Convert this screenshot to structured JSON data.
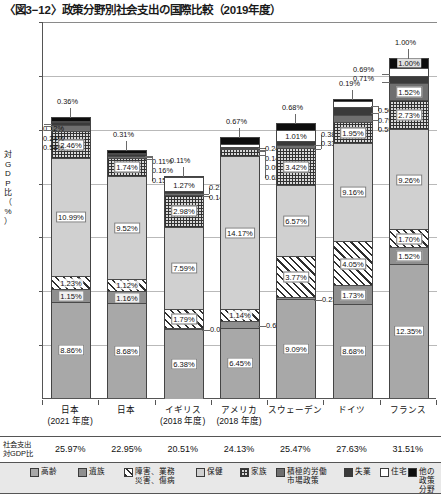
{
  "title": "〈図3−12〉政策分野別社会支出の国際比較（2019年度）",
  "axis": {
    "y_label": "対GDP比（%）",
    "y_ticks": [
      "35%",
      "30%",
      "25%",
      "20%",
      "15%",
      "10%",
      "5%"
    ]
  },
  "totals_row": {
    "label": "社会支出\n対GDP比",
    "values": [
      "25.97%",
      "22.95%",
      "20.51%",
      "24.13%",
      "25.47%",
      "27.63%",
      "31.51%"
    ]
  },
  "legend": [
    {
      "key": "koure",
      "label": "高齢",
      "color": "#a8a8a8"
    },
    {
      "key": "izoku",
      "label": "遺族",
      "color": "#8f8f8f"
    },
    {
      "key": "shogai",
      "label": "障害、業務\n災害、傷病",
      "color": "#ffffff"
    },
    {
      "key": "hoken",
      "label": "保健",
      "color": "#d0d0d0"
    },
    {
      "key": "kazoku",
      "label": "家族",
      "color": "#d8d8d8"
    },
    {
      "key": "roudou",
      "label": "積極的労働\n市場政策",
      "color": "#6f6f6f"
    },
    {
      "key": "shitsugyo",
      "label": "失業",
      "color": "#3a3a3a"
    },
    {
      "key": "jutaku",
      "label": "住宅",
      "color": "#ffffff"
    },
    {
      "key": "hoka",
      "label": "他の\n政策分野",
      "color": "#0d0d0d"
    }
  ],
  "chart_data": {
    "type": "bar",
    "stacked": true,
    "title": "〈図3−12〉政策分野別社会支出の国際比較（2019年度）",
    "xlabel": "",
    "ylabel": "対GDP比（%）",
    "ylim": [
      0,
      35
    ],
    "ytick_step": 5,
    "grid": true,
    "legend_position": "bottom",
    "categories": [
      "日本\n(2021 年度)",
      "日本",
      "イギリス\n(2018 年度)",
      "アメリカ\n(2018 年度)",
      "スウェーデン",
      "ドイツ",
      "フランス"
    ],
    "series": [
      {
        "name": "高齢",
        "values": [
          8.86,
          8.68,
          6.38,
          6.45,
          9.09,
          8.68,
          12.35
        ]
      },
      {
        "name": "遺族",
        "values": [
          1.15,
          1.16,
          0.03,
          0.61,
          0.23,
          1.73,
          1.52
        ]
      },
      {
        "name": "障害、業務災害、傷病",
        "values": [
          1.23,
          1.12,
          1.79,
          1.14,
          3.77,
          4.05,
          1.7
        ]
      },
      {
        "name": "保健",
        "values": [
          10.99,
          9.52,
          7.59,
          14.17,
          6.57,
          9.16,
          9.26
        ]
      },
      {
        "name": "家族",
        "values": [
          2.46,
          1.74,
          2.98,
          0.62,
          3.42,
          1.95,
          2.73
        ]
      },
      {
        "name": "積極的労働市場政策",
        "values": [
          0.58,
          0.15,
          0.14,
          0.09,
          0.33,
          0.59,
          1.52
        ]
      },
      {
        "name": "失業",
        "values": [
          0.24,
          0.16,
          0.21,
          0.14,
          0.38,
          0.79,
          0.71
        ]
      },
      {
        "name": "住宅",
        "values": [
          0.12,
          0.11,
          1.27,
          0.24,
          1.01,
          0.5,
          0.69
        ]
      },
      {
        "name": "他の政策分野",
        "values": [
          0.36,
          0.31,
          0.11,
          0.67,
          0.68,
          0.19,
          1.0
        ]
      }
    ],
    "totals": [
      25.97,
      22.95,
      20.51,
      24.13,
      25.47,
      27.63,
      31.51
    ]
  },
  "labels": {
    "b0": {
      "koure": "8.86%",
      "izoku": "1.15%",
      "shogai": "1.23%",
      "hoken": "10.99%",
      "kazoku": "2.46%",
      "roudou": "0.58%",
      "shitsugyo": "0.24%",
      "jutaku": "0.12%",
      "hoka": "0.36%"
    },
    "b1": {
      "koure": "8.68%",
      "izoku": "1.16%",
      "shogai": "1.12%",
      "hoken": "9.52%",
      "kazoku": "1.74%",
      "roudou": "0.15%",
      "shitsugyo": "0.16%",
      "jutaku": "0.11%",
      "hoka": "0.31%"
    },
    "b2": {
      "koure": "6.38%",
      "izoku": "0.03%",
      "shogai": "1.79%",
      "hoken": "7.59%",
      "kazoku": "2.98%",
      "roudou": "0.14%",
      "shitsugyo": "0.21%",
      "jutaku": "1.27%",
      "hoka": "0.11%"
    },
    "b3": {
      "koure": "6.45%",
      "izoku": "0.61%",
      "shogai": "1.14%",
      "hoken": "14.17%",
      "kazoku": "0.62%",
      "roudou": "0.09%",
      "shitsugyo": "0.14%",
      "jutaku": "0.24%",
      "hoka": "0.67%"
    },
    "b4": {
      "koure": "9.09%",
      "izoku": "0.23%",
      "shogai": "3.77%",
      "hoken": "6.57%",
      "kazoku": "3.42%",
      "roudou": "0.33%",
      "shitsugyo": "0.38%",
      "jutaku": "1.01%",
      "hoka": "0.68%"
    },
    "b5": {
      "koure": "8.68%",
      "izoku": "1.73%",
      "shogai": "4.05%",
      "hoken": "9.16%",
      "kazoku": "1.95%",
      "roudou": "0.59%",
      "shitsugyo": "0.79%",
      "jutaku": "0.50%",
      "hoka": "0.19%"
    },
    "b6": {
      "koure": "12.35%",
      "izoku": "1.52%",
      "shogai": "1.70%",
      "hoken": "9.26%",
      "kazoku": "2.73%",
      "roudou": "1.52%",
      "shitsugyo": "0.71%",
      "jutaku": "0.69%",
      "hoka": "1.00%"
    }
  }
}
